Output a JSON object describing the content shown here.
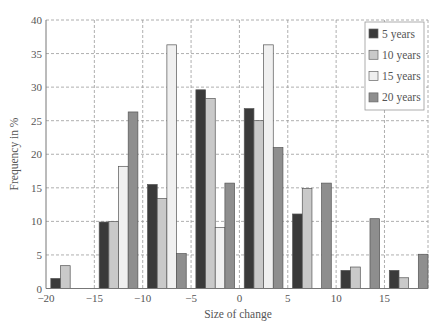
{
  "chart_data": {
    "type": "bar",
    "title": "",
    "xlabel": "Size of change",
    "ylabel": "Frequency in %",
    "xlim": [
      -20,
      19.5
    ],
    "ylim": [
      0,
      40
    ],
    "xticks": [
      -20,
      -15,
      -10,
      -5,
      0,
      5,
      10,
      15
    ],
    "yticks": [
      0,
      5,
      10,
      15,
      20,
      25,
      30,
      35,
      40
    ],
    "grid": true,
    "legend_position": "upper right",
    "bin_width": 5,
    "categories": [
      -20,
      -15,
      -10,
      -5,
      0,
      5,
      10,
      15
    ],
    "series": [
      {
        "name": "5 years",
        "color": "#3a3a3a",
        "values": [
          1.5,
          9.9,
          15.5,
          29.6,
          26.8,
          11.1,
          2.7,
          2.7
        ]
      },
      {
        "name": "10 years",
        "color": "#c9c9c9",
        "values": [
          3.4,
          10.0,
          13.4,
          28.3,
          25.0,
          14.9,
          3.2,
          1.6
        ]
      },
      {
        "name": "15 years",
        "color": "#f0f0f0",
        "values": [
          0,
          18.2,
          36.3,
          9.1,
          36.3,
          0,
          0,
          0
        ]
      },
      {
        "name": "20 years",
        "color": "#8e8e8e",
        "values": [
          0,
          26.3,
          5.2,
          15.7,
          21.0,
          15.7,
          10.4,
          5.1
        ]
      }
    ]
  }
}
